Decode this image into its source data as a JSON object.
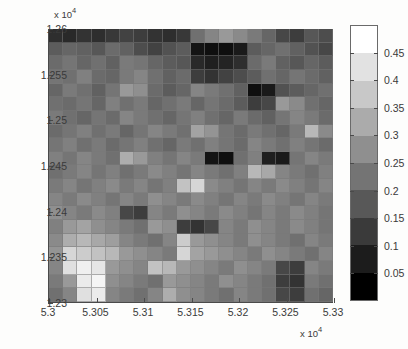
{
  "figure": {
    "kind": "grayscale-heatmap",
    "background_color": "#ffffff",
    "axis_color": "#4a4a4a"
  },
  "axes": {
    "x_exponent_text": "x 10",
    "x_exponent_power": "4",
    "y_exponent_text": "x 10",
    "y_exponent_power": "4"
  },
  "colorbar": {
    "position": "right",
    "tick_labels": [
      "0.45",
      "0.4",
      "0.35",
      "0.3",
      "0.25",
      "0.2",
      "0.15",
      "0.1",
      "0.05"
    ],
    "tick_values": [
      0.45,
      0.4,
      0.35,
      0.3,
      0.25,
      0.2,
      0.15,
      0.1,
      0.05
    ],
    "band_colors": [
      "#ffffff",
      "#e2e2e2",
      "#c8c8c8",
      "#ababab",
      "#8f8f8f",
      "#747474",
      "#585858",
      "#3a3a3a",
      "#1c1c1c",
      "#000000"
    ],
    "range_min": 0.0,
    "range_max": 0.5
  },
  "chart_data": {
    "type": "heatmap",
    "title": "",
    "xlabel": "",
    "ylabel": "",
    "xlim": [
      53000,
      53300
    ],
    "ylim": [
      12300,
      12600
    ],
    "zlim": [
      0.0,
      0.5
    ],
    "grid": false,
    "legend_position": "right-colorbar",
    "colormap": "gray",
    "x_tick_labels": [
      "5.3",
      "5.305",
      "5.31",
      "5.315",
      "5.32",
      "5.325",
      "5.33"
    ],
    "x_tick_values": [
      53000,
      53050,
      53100,
      53150,
      53200,
      53250,
      53300
    ],
    "y_tick_labels": [
      "1.26",
      "1.255",
      "1.25",
      "1.245",
      "1.24",
      "1.235",
      "1.23"
    ],
    "y_tick_values": [
      12600,
      12550,
      12500,
      12450,
      12400,
      12350,
      12300
    ],
    "x_multiplier": 10000,
    "y_multiplier": 10000,
    "n_cols": 20,
    "n_rows": 20,
    "annotations": [
      "Dark (low-value) cluster concentrated in the upper-right region",
      "Bright (high-value) cells concentrated in the lower-left region"
    ],
    "values": [
      [
        0.09,
        0.08,
        0.1,
        0.09,
        0.11,
        0.13,
        0.12,
        0.1,
        0.09,
        0.11,
        0.22,
        0.26,
        0.3,
        0.27,
        0.24,
        0.2,
        0.14,
        0.12,
        0.17,
        0.15
      ],
      [
        0.18,
        0.2,
        0.19,
        0.17,
        0.21,
        0.19,
        0.15,
        0.13,
        0.16,
        0.18,
        0.04,
        0.03,
        0.03,
        0.05,
        0.18,
        0.2,
        0.22,
        0.19,
        0.16,
        0.14
      ],
      [
        0.21,
        0.23,
        0.2,
        0.22,
        0.19,
        0.24,
        0.23,
        0.2,
        0.18,
        0.17,
        0.08,
        0.06,
        0.07,
        0.09,
        0.21,
        0.24,
        0.19,
        0.17,
        0.2,
        0.18
      ],
      [
        0.23,
        0.22,
        0.25,
        0.21,
        0.2,
        0.24,
        0.26,
        0.22,
        0.19,
        0.21,
        0.12,
        0.1,
        0.13,
        0.15,
        0.18,
        0.22,
        0.2,
        0.23,
        0.21,
        0.19
      ],
      [
        0.2,
        0.24,
        0.22,
        0.19,
        0.23,
        0.3,
        0.28,
        0.21,
        0.18,
        0.2,
        0.26,
        0.24,
        0.22,
        0.19,
        0.03,
        0.05,
        0.16,
        0.18,
        0.2,
        0.22
      ],
      [
        0.22,
        0.21,
        0.23,
        0.2,
        0.25,
        0.22,
        0.24,
        0.2,
        0.22,
        0.24,
        0.2,
        0.23,
        0.21,
        0.18,
        0.12,
        0.14,
        0.3,
        0.27,
        0.22,
        0.2
      ],
      [
        0.24,
        0.22,
        0.2,
        0.23,
        0.21,
        0.26,
        0.24,
        0.22,
        0.2,
        0.23,
        0.25,
        0.22,
        0.2,
        0.24,
        0.21,
        0.19,
        0.23,
        0.26,
        0.24,
        0.21
      ],
      [
        0.21,
        0.23,
        0.25,
        0.22,
        0.24,
        0.2,
        0.23,
        0.26,
        0.24,
        0.22,
        0.32,
        0.29,
        0.23,
        0.21,
        0.24,
        0.22,
        0.2,
        0.24,
        0.36,
        0.27
      ],
      [
        0.23,
        0.25,
        0.22,
        0.24,
        0.21,
        0.23,
        0.25,
        0.22,
        0.2,
        0.24,
        0.22,
        0.25,
        0.23,
        0.21,
        0.26,
        0.24,
        0.22,
        0.25,
        0.23,
        0.21
      ],
      [
        0.25,
        0.23,
        0.26,
        0.24,
        0.22,
        0.34,
        0.3,
        0.25,
        0.23,
        0.26,
        0.24,
        0.04,
        0.03,
        0.22,
        0.25,
        0.06,
        0.05,
        0.23,
        0.26,
        0.24
      ],
      [
        0.22,
        0.24,
        0.26,
        0.23,
        0.25,
        0.22,
        0.24,
        0.27,
        0.25,
        0.23,
        0.26,
        0.24,
        0.22,
        0.25,
        0.36,
        0.33,
        0.26,
        0.24,
        0.22,
        0.25
      ],
      [
        0.24,
        0.26,
        0.23,
        0.25,
        0.27,
        0.24,
        0.26,
        0.23,
        0.25,
        0.38,
        0.42,
        0.27,
        0.25,
        0.23,
        0.26,
        0.24,
        0.27,
        0.25,
        0.23,
        0.26
      ],
      [
        0.26,
        0.24,
        0.27,
        0.25,
        0.23,
        0.26,
        0.24,
        0.28,
        0.26,
        0.24,
        0.27,
        0.25,
        0.23,
        0.26,
        0.24,
        0.27,
        0.25,
        0.23,
        0.26,
        0.24
      ],
      [
        0.28,
        0.26,
        0.24,
        0.27,
        0.25,
        0.14,
        0.12,
        0.26,
        0.24,
        0.28,
        0.26,
        0.24,
        0.27,
        0.25,
        0.23,
        0.26,
        0.24,
        0.27,
        0.25,
        0.23
      ],
      [
        0.25,
        0.3,
        0.32,
        0.28,
        0.26,
        0.24,
        0.22,
        0.3,
        0.28,
        0.12,
        0.1,
        0.14,
        0.26,
        0.24,
        0.28,
        0.26,
        0.24,
        0.27,
        0.25,
        0.23
      ],
      [
        0.27,
        0.34,
        0.36,
        0.33,
        0.31,
        0.26,
        0.24,
        0.22,
        0.26,
        0.4,
        0.3,
        0.28,
        0.26,
        0.24,
        0.28,
        0.26,
        0.24,
        0.22,
        0.26,
        0.24
      ],
      [
        0.29,
        0.42,
        0.4,
        0.38,
        0.36,
        0.3,
        0.28,
        0.26,
        0.24,
        0.42,
        0.32,
        0.3,
        0.28,
        0.26,
        0.24,
        0.28,
        0.26,
        0.24,
        0.22,
        0.26
      ],
      [
        0.26,
        0.44,
        0.47,
        0.45,
        0.3,
        0.28,
        0.26,
        0.38,
        0.36,
        0.3,
        0.28,
        0.26,
        0.24,
        0.28,
        0.26,
        0.24,
        0.14,
        0.12,
        0.26,
        0.24
      ],
      [
        0.24,
        0.3,
        0.46,
        0.48,
        0.28,
        0.26,
        0.24,
        0.22,
        0.3,
        0.28,
        0.26,
        0.24,
        0.28,
        0.26,
        0.24,
        0.22,
        0.12,
        0.1,
        0.24,
        0.22
      ],
      [
        0.22,
        0.26,
        0.44,
        0.46,
        0.26,
        0.24,
        0.22,
        0.26,
        0.34,
        0.28,
        0.26,
        0.24,
        0.22,
        0.26,
        0.24,
        0.22,
        0.14,
        0.12,
        0.22,
        0.2
      ]
    ]
  }
}
